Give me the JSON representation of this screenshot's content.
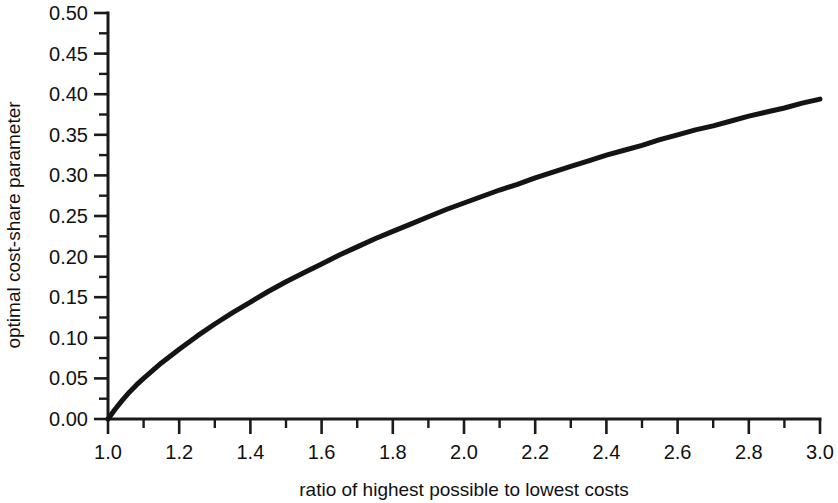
{
  "chart_data": {
    "type": "line",
    "title": "",
    "xlabel": "ratio of highest possible to lowest costs",
    "ylabel": "optimal cost-share parameter",
    "xlim": [
      1.0,
      3.0
    ],
    "ylim": [
      0.0,
      0.5
    ],
    "grid": false,
    "legend": null,
    "x_ticks": [
      "1.0",
      "1.2",
      "1.4",
      "1.6",
      "1.8",
      "2.0",
      "2.2",
      "2.4",
      "2.6",
      "2.8",
      "3.0"
    ],
    "x_tick_values": [
      1.0,
      1.2,
      1.4,
      1.6,
      1.8,
      2.0,
      2.2,
      2.4,
      2.6,
      2.8,
      3.0
    ],
    "x_minor_tick_values": [
      1.1,
      1.3,
      1.5,
      1.7,
      1.9,
      2.1,
      2.3,
      2.5,
      2.7,
      2.9
    ],
    "y_ticks": [
      "0.00",
      "0.05",
      "0.10",
      "0.15",
      "0.20",
      "0.25",
      "0.30",
      "0.35",
      "0.40",
      "0.45",
      "0.50"
    ],
    "y_tick_values": [
      0.0,
      0.05,
      0.1,
      0.15,
      0.2,
      0.25,
      0.3,
      0.35,
      0.4,
      0.45,
      0.5
    ],
    "y_minor_tick_values": [
      0.025,
      0.075,
      0.125,
      0.175,
      0.225,
      0.275,
      0.325,
      0.375,
      0.425,
      0.475
    ],
    "series": [
      {
        "name": "optimal cost-share parameter",
        "color": "#141414",
        "x": [
          1.0,
          1.02,
          1.04,
          1.06,
          1.08,
          1.1,
          1.15,
          1.2,
          1.25,
          1.3,
          1.35,
          1.4,
          1.45,
          1.5,
          1.55,
          1.6,
          1.65,
          1.7,
          1.75,
          1.8,
          1.85,
          1.9,
          1.95,
          2.0,
          2.05,
          2.1,
          2.15,
          2.2,
          2.25,
          2.3,
          2.35,
          2.4,
          2.45,
          2.5,
          2.55,
          2.6,
          2.65,
          2.7,
          2.75,
          2.8,
          2.85,
          2.9,
          2.95,
          3.0
        ],
        "y": [
          0.0,
          0.012,
          0.023,
          0.033,
          0.042,
          0.05,
          0.069,
          0.086,
          0.102,
          0.117,
          0.131,
          0.144,
          0.157,
          0.169,
          0.18,
          0.191,
          0.202,
          0.212,
          0.222,
          0.231,
          0.24,
          0.249,
          0.258,
          0.266,
          0.274,
          0.282,
          0.289,
          0.297,
          0.304,
          0.311,
          0.318,
          0.325,
          0.331,
          0.337,
          0.344,
          0.35,
          0.356,
          0.361,
          0.367,
          0.373,
          0.378,
          0.383,
          0.389,
          0.394
        ]
      }
    ]
  }
}
